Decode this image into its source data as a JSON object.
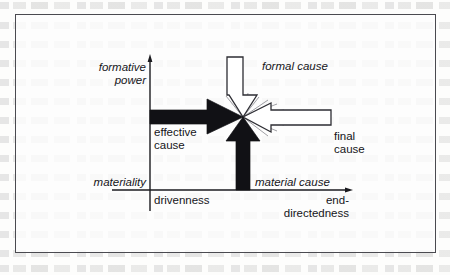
{
  "figure": {
    "kind": "four-causes-diagram",
    "border_color": "#4a4a50",
    "background_color": "#fdfdfc"
  },
  "axes": {
    "vertical": {
      "name": "vertical-axis",
      "top_label": "formative power",
      "top_label_lines": [
        "formative",
        "power"
      ],
      "bottom_label": "materiality",
      "style": "italic",
      "x": 150,
      "y_top": 57,
      "y_bottom": 211,
      "color": "#1a1a1f"
    },
    "horizontal": {
      "name": "horizontal-axis",
      "left_label": "drivenness",
      "right_label": "end-directedness",
      "right_label_lines": [
        "end-",
        "directedness"
      ],
      "style": "upright",
      "y": 190,
      "x_left": 112,
      "x_right": 350,
      "color": "#1a1a1f"
    }
  },
  "convergence_point": {
    "name": "convergence-point",
    "x": 243,
    "y": 117
  },
  "arrows": [
    {
      "id": "effective-cause",
      "label": "effective cause",
      "label_lines": [
        "effective",
        "cause"
      ],
      "label_style": "upright",
      "direction": "right",
      "fill": "#111115",
      "stroke": "#111115",
      "filled": true
    },
    {
      "id": "material-cause",
      "label": "material cause",
      "label_lines": [
        "material cause"
      ],
      "label_style": "italic",
      "direction": "up",
      "fill": "#111115",
      "stroke": "#111115",
      "filled": true
    },
    {
      "id": "formal-cause",
      "label": "formal cause",
      "label_lines": [
        "formal cause"
      ],
      "label_style": "italic",
      "direction": "down",
      "fill": "#ffffff",
      "stroke": "#2d2d33",
      "filled": false
    },
    {
      "id": "final-cause",
      "label": "final cause",
      "label_lines": [
        "final",
        "cause"
      ],
      "label_style": "upright",
      "direction": "left",
      "fill": "#ffffff",
      "stroke": "#2d2d33",
      "filled": false
    }
  ],
  "labels": {
    "formative": "formative",
    "power": "power",
    "materiality": "materiality",
    "drivenness": "drivenness",
    "end_dash": "end-",
    "directedness": "directedness",
    "effective": "effective",
    "cause_effective": "cause",
    "formal_cause": "formal cause",
    "final": "final",
    "cause_final": "cause",
    "material_cause": "material cause"
  }
}
